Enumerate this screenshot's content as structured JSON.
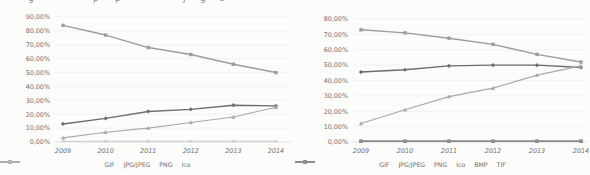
{
  "figure": {
    "description_fragments": [
      "g",
      "p",
      "p",
      "j",
      "g",
      "s"
    ],
    "fragment_x": [
      28,
      93,
      115,
      183,
      200,
      220
    ],
    "text_color": "#6e6e6e",
    "grid_color": "#eeedea",
    "axis_color": "#d2d2ce"
  },
  "chart_data": [
    {
      "type": "line",
      "title": "",
      "xlabel": "",
      "ylabel": "",
      "categories": [
        "2009",
        "2010",
        "2011",
        "2012",
        "2013",
        "2014"
      ],
      "ylim": [
        0,
        90
      ],
      "ytick_step": 10,
      "yticks": [
        "0,00%",
        "10,00%",
        "20,00%",
        "30,00%",
        "40,00%",
        "50,00%",
        "60,00%",
        "70,00%",
        "80,00%",
        "90,00%"
      ],
      "grid": true,
      "legend_position": "bottom",
      "series": [
        {
          "name": "GIF",
          "color": "#9c9c9c",
          "width": 1.4,
          "marker": "square",
          "values": [
            84,
            77,
            68,
            63,
            56,
            50
          ]
        },
        {
          "name": "JPG/JPEG",
          "color": "#6d6d6d",
          "width": 1.4,
          "marker": "diamond",
          "values": [
            13,
            17,
            22,
            23.5,
            26.5,
            26
          ]
        },
        {
          "name": "PNG",
          "color": "#a9a9a9",
          "width": 1.1,
          "marker": "triangle",
          "values": [
            3,
            7,
            10,
            14,
            18,
            25
          ]
        },
        {
          "name": "Ico",
          "color": "#c6c6c6",
          "width": 0.9,
          "marker": "x",
          "values": [
            0.5,
            0.5,
            0.5,
            0.5,
            0.5,
            0.5
          ]
        }
      ]
    },
    {
      "type": "line",
      "title": "",
      "xlabel": "",
      "ylabel": "",
      "categories": [
        "2009",
        "2010",
        "2011",
        "2012",
        "2013",
        "2014"
      ],
      "ylim": [
        0,
        80
      ],
      "ytick_step": 10,
      "yticks": [
        "0,00%",
        "10,00%",
        "20,00%",
        "30,00%",
        "40,00%",
        "50,00%",
        "60,00%",
        "70,00%",
        "80,00%"
      ],
      "grid": true,
      "legend_position": "bottom",
      "series": [
        {
          "name": "GIF",
          "color": "#9c9c9c",
          "width": 1.4,
          "marker": "square",
          "values": [
            73,
            71,
            67.5,
            63.5,
            57,
            52
          ]
        },
        {
          "name": "JPG/JPEG",
          "color": "#6d6d6d",
          "width": 1.4,
          "marker": "diamond",
          "values": [
            45.5,
            47,
            49.5,
            50,
            50,
            48.5
          ]
        },
        {
          "name": "PNG",
          "color": "#a9a9a9",
          "width": 1.2,
          "marker": "triangle",
          "values": [
            12,
            21,
            29.5,
            35,
            43.5,
            49.5
          ]
        },
        {
          "name": "Ico",
          "color": "#c6c6c6",
          "width": 0.9,
          "marker": "x",
          "values": [
            0.5,
            0.5,
            0.5,
            0.5,
            0.5,
            0.5
          ]
        },
        {
          "name": "BMP",
          "color": "#6a6a6a",
          "width": 1.3,
          "marker": "square",
          "values": [
            0.5,
            0.5,
            0.5,
            0.5,
            0.5,
            0.5
          ]
        },
        {
          "name": "TIF",
          "color": "#949494",
          "width": 1.2,
          "marker": "circle",
          "values": [
            0.5,
            0.5,
            0.5,
            0.5,
            0.5,
            0.5
          ]
        }
      ]
    }
  ]
}
